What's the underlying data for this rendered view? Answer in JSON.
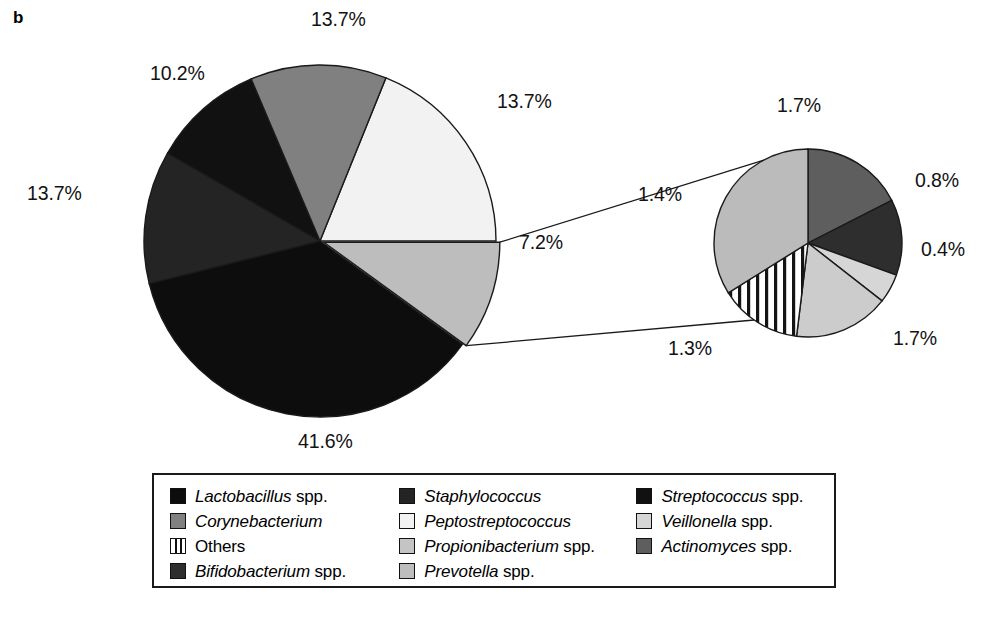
{
  "panel": {
    "letter": "b"
  },
  "colors": {
    "lactobacillus": "#0d0d0d",
    "staphylococcus": "#242424",
    "streptococcus": "#111111",
    "corynebacterium": "#808080",
    "peptostreptococcus": "#f2f2f2",
    "veillonella": "#d6d6d6",
    "others": "#ffffff",
    "propionibacterium": "#c4c4c4",
    "actinomyces": "#5e5e5e",
    "bifidobacterium": "#2e2e2e",
    "prevotella": "#bdbdbd",
    "outline": "#1a1a1a",
    "text": "#121212"
  },
  "legend": {
    "columns": [
      {
        "items": [
          {
            "genus": "Lactobacillus",
            "suffix": " spp.",
            "swatch": "lactobacillus",
            "pattern": "solid"
          },
          {
            "genus": "Corynebacterium",
            "suffix": "",
            "swatch": "corynebacterium",
            "pattern": "solid"
          },
          {
            "genus": "",
            "suffix": "Others",
            "swatch": "others",
            "pattern": "striped"
          },
          {
            "genus": "Bifidobacterium",
            "suffix": " spp.",
            "swatch": "bifidobacterium",
            "pattern": "solid"
          }
        ]
      },
      {
        "items": [
          {
            "genus": "Staphylococcus",
            "suffix": "",
            "swatch": "staphylococcus",
            "pattern": "solid"
          },
          {
            "genus": "Peptostreptococcus",
            "suffix": "",
            "swatch": "peptostreptococcus",
            "pattern": "solid"
          },
          {
            "genus": "Propionibacterium",
            "suffix": " spp.",
            "swatch": "propionibacterium",
            "pattern": "solid"
          },
          {
            "genus": "Prevotella",
            "suffix": " spp.",
            "swatch": "prevotella",
            "pattern": "solid"
          }
        ]
      },
      {
        "items": [
          {
            "genus": "Streptococcus",
            "suffix": " spp.",
            "swatch": "streptococcus",
            "pattern": "solid"
          },
          {
            "genus": "Veillonella",
            "suffix": " spp.",
            "swatch": "veillonella",
            "pattern": "solid"
          },
          {
            "genus": "Actinomyces",
            "suffix": " spp.",
            "swatch": "actinomyces",
            "pattern": "solid"
          }
        ]
      }
    ]
  },
  "chart_data": [
    {
      "type": "pie",
      "name": "main-pie",
      "title": "",
      "center": [
        320,
        241
      ],
      "radius": 176,
      "start_angle_deg": -90,
      "direction": "clockwise",
      "categories": [
        "Peptostreptococcus",
        "Prevotella spp.",
        "Lactobacillus spp.",
        "Staphylococcus",
        "Streptococcus spp.",
        "Corynebacterium"
      ],
      "values": [
        13.7,
        7.2,
        41.6,
        13.7,
        10.2,
        13.7
      ],
      "labels": [
        "13.7%",
        "7.2%",
        "41.6%",
        "13.7%",
        "10.2%",
        "13.7%"
      ],
      "colors": [
        "#f2f2f2",
        "#bdbdbd",
        "#0d0d0d",
        "#242424",
        "#111111",
        "#808080"
      ],
      "exploded_slice": "Prevotella spp."
    },
    {
      "type": "pie",
      "name": "detail-pie",
      "title": "",
      "center": [
        808,
        243
      ],
      "radius": 94,
      "start_angle_deg": -90,
      "direction": "clockwise",
      "categories": [
        "Actinomyces spp.",
        "Bifidobacterium spp.",
        "Veillonella spp.",
        "Propionibacterium spp.",
        "Others",
        "Prevotella spp."
      ],
      "values": [
        1.7,
        0.8,
        0.4,
        1.7,
        1.3,
        1.4
      ],
      "labels": [
        "1.7%",
        "0.8%",
        "0.4%",
        "1.7%",
        "1.3%",
        "1.4%"
      ],
      "colors": [
        "#5e5e5e",
        "#2e2e2e",
        "#d6d6d6",
        "#cccccc",
        "#ffffff",
        "#bbbbbb"
      ],
      "note": "expansion of the 7.2% Prevotella-group slice of the main pie"
    }
  ],
  "main_labels": [
    {
      "id": "main-top",
      "text": "13.7%",
      "x": 311,
      "y": 8
    },
    {
      "id": "main-upper-left",
      "text": "10.2%",
      "x": 150,
      "y": 62
    },
    {
      "id": "main-left",
      "text": "13.7%",
      "x": 27,
      "y": 182
    },
    {
      "id": "main-bottom",
      "text": "41.6%",
      "x": 298,
      "y": 430
    },
    {
      "id": "main-right",
      "text": "13.7%",
      "x": 497,
      "y": 90
    },
    {
      "id": "main-explode",
      "text": "7.2%",
      "x": 519,
      "y": 231
    }
  ],
  "detail_labels": [
    {
      "id": "detail-top",
      "text": "1.7%",
      "x": 777,
      "y": 94
    },
    {
      "id": "detail-right-upper",
      "text": "0.8%",
      "x": 915,
      "y": 169
    },
    {
      "id": "detail-right-lower",
      "text": "0.4%",
      "x": 921,
      "y": 238
    },
    {
      "id": "detail-bottom-right",
      "text": "1.7%",
      "x": 893,
      "y": 327
    },
    {
      "id": "detail-bottom-left",
      "text": "1.3%",
      "x": 668,
      "y": 337
    },
    {
      "id": "detail-left",
      "text": "1.4%",
      "x": 638,
      "y": 183
    }
  ]
}
